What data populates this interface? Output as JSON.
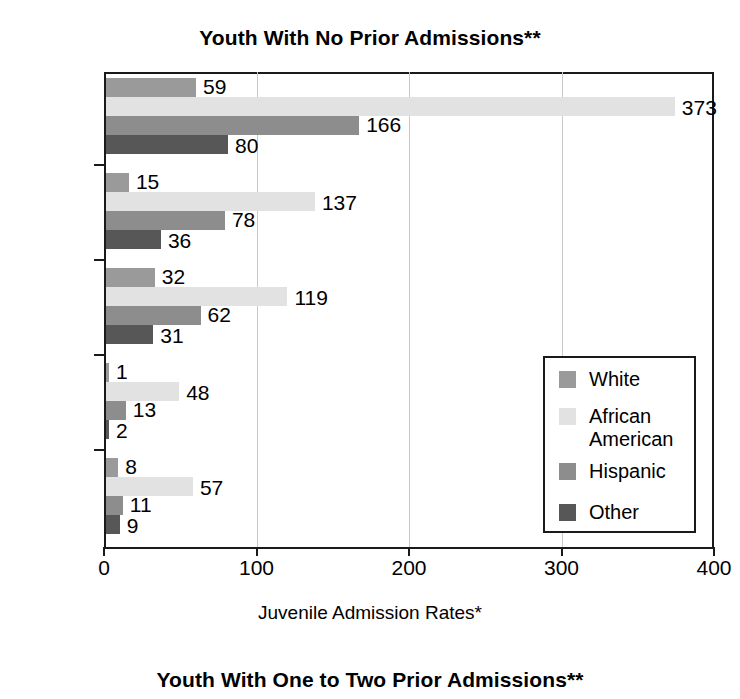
{
  "titles": {
    "main": "Youth With No Prior Admissions**",
    "next_section": "Youth With One to Two Prior Admissions**"
  },
  "chart_data": {
    "type": "bar",
    "orientation": "horizontal",
    "title": "Youth With No Prior Admissions**",
    "xlabel": "Juvenile Admission Rates*",
    "ylabel": "",
    "xlim": [
      0,
      400
    ],
    "xticks": [
      0,
      100,
      200,
      300,
      400
    ],
    "grid": true,
    "legend_position": "inside-right",
    "categories": [
      "Total",
      "Person",
      "Property",
      "Drug",
      "Public\nOrder"
    ],
    "series": [
      {
        "name": "White",
        "color": "#9a9a9a",
        "values": [
          59,
          15,
          32,
          1,
          8
        ]
      },
      {
        "name": "African\nAmerican",
        "color": "#e2e2e2",
        "values": [
          373,
          137,
          119,
          48,
          57
        ]
      },
      {
        "name": "Hispanic",
        "color": "#8d8d8d",
        "values": [
          166,
          78,
          62,
          13,
          11
        ]
      },
      {
        "name": "Other",
        "color": "#575757",
        "values": [
          80,
          36,
          31,
          2,
          9
        ]
      }
    ]
  },
  "axis": {
    "x_title": "Juvenile Admission Rates*",
    "tick_labels": [
      "0",
      "100",
      "200",
      "300",
      "400"
    ]
  },
  "legend": {
    "entries": [
      {
        "label": "White",
        "color": "#9a9a9a"
      },
      {
        "label": "African\nAmerican",
        "color": "#e2e2e2"
      },
      {
        "label": "Hispanic",
        "color": "#8d8d8d"
      },
      {
        "label": "Other",
        "color": "#575757"
      }
    ]
  }
}
